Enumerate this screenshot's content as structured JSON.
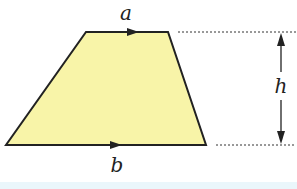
{
  "diagram": {
    "type": "trapezium",
    "labels": {
      "top": "a",
      "bottom": "b",
      "height": "h"
    },
    "colors": {
      "fill": "#f8f4a8",
      "stroke": "#222222",
      "strip": "#eaf6fb"
    }
  }
}
